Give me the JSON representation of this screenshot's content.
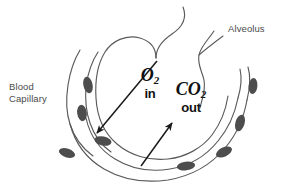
{
  "diagram": {
    "background_color": "#ffffff",
    "stroke_color": "#5a5a5a",
    "cell_fill_color": "#4d4d4d",
    "arrow_color": "#1a1a1a",
    "labels": {
      "blood_capillary": "Blood\nCapillary",
      "alveolus": "Alveolus"
    },
    "gases": {
      "oxygen": {
        "formula": "O",
        "subscript": "2",
        "direction": "in"
      },
      "carbon_dioxide": {
        "formula": "CO",
        "subscript": "2",
        "direction": "out"
      }
    },
    "arrows": [
      {
        "name": "oxygen-diffusion-arrow",
        "direction": "down-left"
      },
      {
        "name": "carbon-dioxide-diffusion-arrow",
        "direction": "up-right"
      }
    ],
    "blood_cell_count": 8
  }
}
